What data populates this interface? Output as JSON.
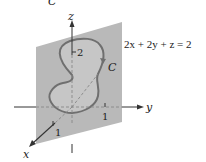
{
  "diagram": {
    "top_fragment": "C",
    "plane_equation": "2x + 2y + z = 2",
    "curve_label": "C",
    "axes": {
      "x": "x",
      "y": "y",
      "z": "z"
    },
    "ticks": {
      "z": "2",
      "y": "1",
      "x": "1"
    },
    "colors": {
      "plane": "#b9b9b9",
      "curve": "#6f6f6f",
      "curve_interior": "#c9c9c9",
      "axis": "#333333",
      "dashed_axis": "#888888"
    }
  }
}
